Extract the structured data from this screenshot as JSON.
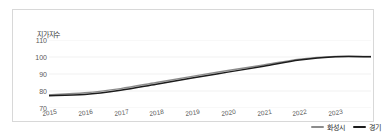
{
  "chart_data": {
    "type": "line",
    "title": "",
    "subtitle": "",
    "ylabel": "지가지수",
    "xlabel": "",
    "categories": [
      "2015",
      "2016",
      "2017",
      "2018",
      "2019",
      "2020",
      "2021",
      "2022",
      "2023"
    ],
    "x": [
      2015,
      2016,
      2017,
      2018,
      2019,
      2020,
      2021,
      2022,
      2023
    ],
    "yticks": [
      "110",
      "100",
      "90",
      "80",
      "70"
    ],
    "ytick_values": [
      110,
      100,
      90,
      80,
      70
    ],
    "ylim": [
      70,
      110
    ],
    "xlim": [
      2015,
      2024
    ],
    "grid": true,
    "grid_axis": "y",
    "legend_position": "bottom-right",
    "series": [
      {
        "name": "화성시",
        "color": "#8c8c8c",
        "values": [
          77.8,
          78.9,
          81.4,
          85.0,
          88.6,
          92.0,
          95.3,
          98.7,
          100.3
        ]
      },
      {
        "name": "경기",
        "color": "#1c1c1c",
        "values": [
          77.2,
          77.9,
          80.4,
          84.0,
          87.6,
          91.1,
          94.5,
          98.2,
          100.1
        ]
      }
    ]
  },
  "legend": {
    "items": [
      {
        "label": "화성시",
        "color": "#8c8c8c"
      },
      {
        "label": "경기",
        "color": "#1c1c1c"
      }
    ]
  },
  "colors": {
    "border": "#d8d8d8",
    "grid": "#ededed",
    "axis_text": "#5a5a5a",
    "label_text": "#3a3a3a",
    "background": "#ffffff"
  }
}
